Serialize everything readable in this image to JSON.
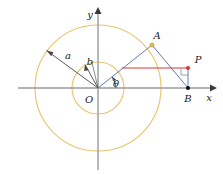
{
  "figure": {
    "background": "#ffffff",
    "width": 223,
    "height": 175,
    "colors": {
      "circle": "#e8c46a",
      "axis": "#9a9a9a",
      "ray": "#4a4a4a",
      "segment": "#5566bb",
      "highlight": "#d83a2e",
      "point_a": "#e8b93a",
      "point_b": "#111111",
      "point_p": "#d83a2e",
      "text": "#1a1a1a"
    },
    "origin": {
      "x": 98,
      "y": 88
    },
    "circles": [
      {
        "name": "outer-circle",
        "radius": 63,
        "label": "a"
      },
      {
        "name": "inner-circle",
        "radius": 26,
        "label": "b"
      }
    ],
    "axes": {
      "x_label": "x",
      "y_label": "y",
      "x_from": {
        "x": 18,
        "y": 88
      },
      "x_to": {
        "x": 214,
        "y": 88
      },
      "y_from": {
        "x": 98,
        "y": 168
      },
      "y_to": {
        "x": 98,
        "y": 10
      }
    },
    "labels": {
      "origin": "O",
      "semi_major": "a",
      "semi_minor": "b",
      "angle": "θ",
      "point_a": "A",
      "point_b": "B",
      "point_p": "P",
      "axis_x": "x",
      "axis_y": "y"
    },
    "points": [
      {
        "name": "point-A",
        "label": "A",
        "x": 152,
        "y": 45,
        "color": "#e8b93a"
      },
      {
        "name": "point-B",
        "label": "B",
        "x": 188,
        "y": 88,
        "color": "#111111"
      },
      {
        "name": "point-P",
        "label": "P",
        "x": 188,
        "y": 68,
        "color": "#d83a2e"
      }
    ],
    "label_positions": {
      "a": {
        "x": 68,
        "y": 58
      },
      "b": {
        "x": 90,
        "y": 63
      },
      "theta": {
        "x": 113,
        "y": 84
      },
      "A": {
        "x": 155,
        "y": 38
      },
      "B": {
        "x": 186,
        "y": 101
      },
      "P": {
        "x": 196,
        "y": 63
      },
      "O": {
        "x": 89,
        "y": 101
      },
      "x": {
        "x": 207,
        "y": 100
      },
      "y": {
        "x": 90,
        "y": 16
      }
    },
    "rays": [
      {
        "name": "ray-a",
        "from": {
          "x": 98,
          "y": 88
        },
        "to": {
          "x": 46,
          "y": 50
        }
      },
      {
        "name": "ray-b",
        "from": {
          "x": 98,
          "y": 88
        },
        "to": {
          "x": 85,
          "y": 64
        }
      }
    ],
    "segments": [
      {
        "name": "segment-OA",
        "from": {
          "x": 98,
          "y": 88
        },
        "to": {
          "x": 152,
          "y": 45
        },
        "color": "#5566bb"
      },
      {
        "name": "segment-AB",
        "from": {
          "x": 152,
          "y": 45
        },
        "to": {
          "x": 188,
          "y": 88
        },
        "color": "#5566bb"
      },
      {
        "name": "segment-PH",
        "from": {
          "x": 122,
          "y": 68
        },
        "to": {
          "x": 188,
          "y": 68
        },
        "color": "#d83a2e"
      },
      {
        "name": "segment-PB",
        "from": {
          "x": 188,
          "y": 68
        },
        "to": {
          "x": 188,
          "y": 88
        },
        "color": "#5566bb"
      }
    ],
    "angle_arc": {
      "name": "theta-arc",
      "center": {
        "x": 98,
        "y": 88
      },
      "radius": 18,
      "start_deg": 0,
      "end_deg": 38
    },
    "right_angle_marker": {
      "name": "right-angle-marker",
      "corner": {
        "x": 188,
        "y": 68
      },
      "size": 7
    }
  }
}
